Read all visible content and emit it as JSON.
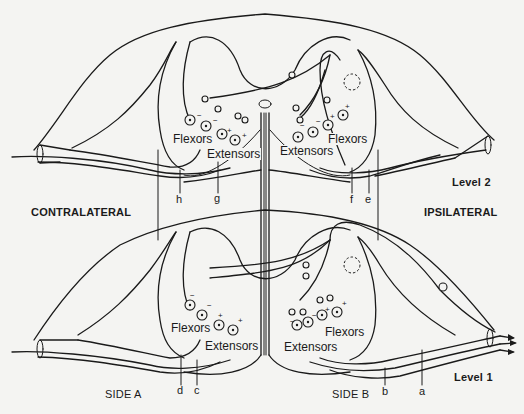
{
  "diagram": {
    "levels": [
      {
        "id": "level2",
        "label": "Level 2"
      },
      {
        "id": "level1",
        "label": "Level 1"
      }
    ],
    "sides": {
      "left_region": "CONTRALATERAL",
      "right_region": "IPSILATERAL",
      "side_a": "SIDE A",
      "side_b": "SIDE B"
    },
    "muscle_groups": {
      "flexors": "Flexors",
      "extensors": "Extensors"
    },
    "level2_labels": {
      "left_flexors": "Flexors",
      "left_extensors": "Extensors",
      "right_flexors": "Flexors",
      "right_extensors": "Extensors"
    },
    "level1_labels": {
      "left_flexors": "Flexors",
      "left_extensors": "Extensors",
      "right_flexors": "Flexors",
      "right_extensors": "Extensors"
    },
    "nerve_letters": {
      "h": "h",
      "g": "g",
      "f": "f",
      "e": "e",
      "d": "d",
      "c": "c",
      "b": "b",
      "a": "a"
    },
    "signs": {
      "plus": "+",
      "minus": "−"
    },
    "colors": {
      "ink": "#1a1a1a",
      "paper": "#f4f4f2"
    }
  }
}
